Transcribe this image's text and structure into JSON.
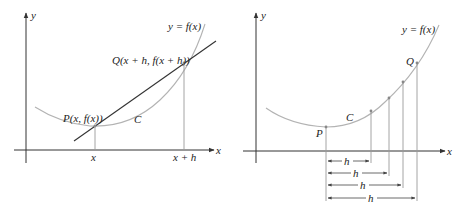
{
  "left_panel": {
    "axes": {
      "x_label": "x",
      "y_label": "y"
    },
    "curve_label": "y = f(x)",
    "curve_name": "C",
    "point_p_label": "P(x, f(x))",
    "point_q_label": "Q(x + h, f(x + h))",
    "tick_x": "x",
    "tick_x_plus_h": "x + h"
  },
  "right_panel": {
    "axes": {
      "x_label": "x",
      "y_label": "y"
    },
    "curve_label": "y = f(x)",
    "curve_name": "C",
    "point_p_label": "P",
    "point_q_label": "Q",
    "h_labels": [
      "h",
      "h",
      "h",
      "h"
    ]
  },
  "colors": {
    "curve": "#b3b3b3",
    "axes": "#333333",
    "secant": "#333333",
    "guide_lines": "#9a9a9a",
    "text": "#222222"
  }
}
